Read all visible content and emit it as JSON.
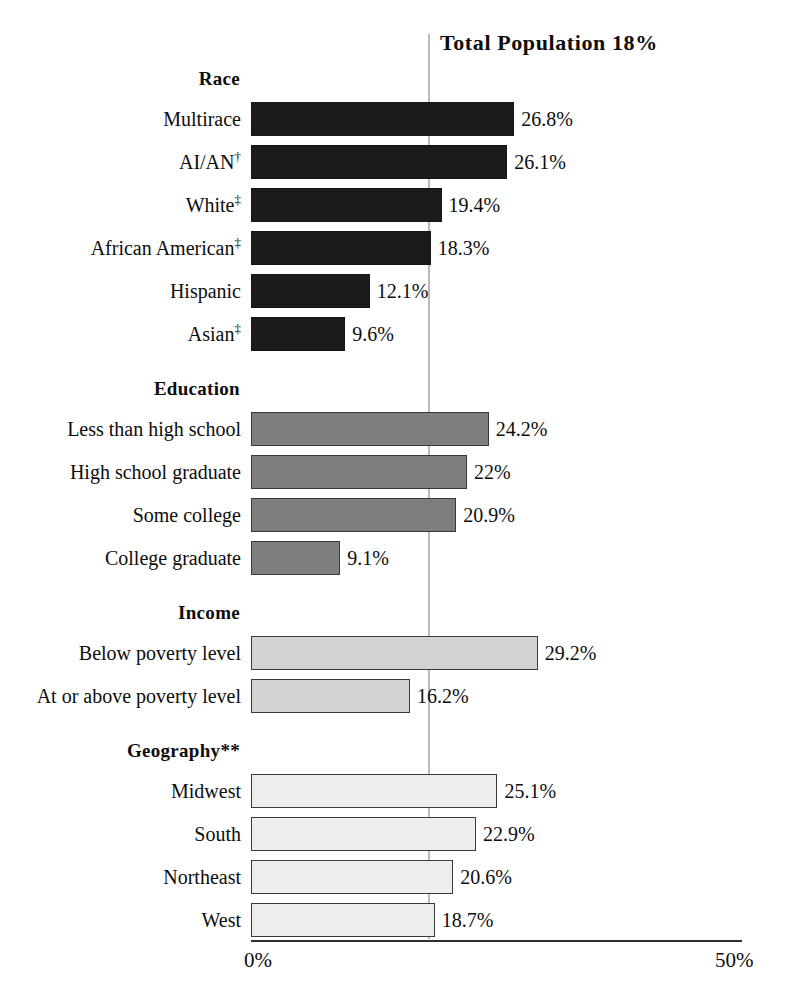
{
  "chart_data": {
    "type": "bar",
    "orientation": "horizontal",
    "title": "Total  Population  18%",
    "xlabel": "",
    "ylabel": "",
    "xlim": [
      0,
      50
    ],
    "xticks": [
      "0%",
      "50%"
    ],
    "xtick_values": [
      0,
      50
    ],
    "grid": false,
    "legend": "none",
    "reference_line": {
      "label": "Total Population",
      "value": 18,
      "value_label": "18%",
      "color": "#b9b9b9"
    },
    "groups": [
      {
        "name": "Race",
        "fill_color": "#1b1b1b",
        "categories": [
          "Multirace",
          "AI/AN†",
          "White‡",
          "African American‡",
          "Hispanic",
          "Asian‡"
        ],
        "values": [
          26.8,
          26.1,
          19.4,
          18.3,
          12.1,
          9.6
        ],
        "value_labels": [
          "26.8%",
          "26.1%",
          "19.4%",
          "18.3%",
          "12.1%",
          "9.6%"
        ]
      },
      {
        "name": "Education",
        "fill_color": "#7e7e7e",
        "categories": [
          "Less than high school",
          "High school graduate",
          "Some college",
          "College graduate"
        ],
        "values": [
          24.2,
          22,
          20.9,
          9.1
        ],
        "value_labels": [
          "24.2%",
          "22%",
          "20.9%",
          "9.1%"
        ]
      },
      {
        "name": "Income",
        "fill_color": "#d2d2d2",
        "categories": [
          "Below poverty level",
          "At or above poverty level"
        ],
        "values": [
          29.2,
          16.2
        ],
        "value_labels": [
          "29.2%",
          "16.2%"
        ]
      },
      {
        "name": "Geography**",
        "fill_color": "#ededed",
        "categories": [
          "Midwest",
          "South",
          "Northeast",
          "West"
        ],
        "values": [
          25.1,
          22.9,
          20.6,
          18.7
        ],
        "value_labels": [
          "25.1%",
          "22.9%",
          "20.6%",
          "18.7%"
        ]
      }
    ]
  }
}
